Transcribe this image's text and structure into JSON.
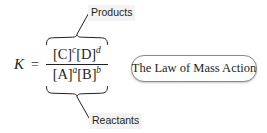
{
  "figure": {
    "background_color": "#ffffff",
    "ink_color": "#231f20",
    "label_background_color": "#f3f3f1",
    "box_border_color": "#8b8b8b"
  },
  "equation": {
    "constant_symbol": "K",
    "relation": "=",
    "numerator": {
      "terms": [
        {
          "species": "[C]",
          "exponent": "c"
        },
        {
          "species": "[D]",
          "exponent": "d"
        }
      ]
    },
    "denominator": {
      "terms": [
        {
          "species": "[A]",
          "exponent": "a"
        },
        {
          "species": "[B]",
          "exponent": "b"
        }
      ]
    }
  },
  "annotations": {
    "products_label": "Products",
    "reactants_label": "Reactants",
    "products_brace": "overbrace-icon",
    "reactants_brace": "underbrace-icon",
    "products_leader": "leader-line-icon",
    "reactants_leader": "leader-line-icon"
  },
  "statement": {
    "text": "The Law of Mass Action"
  }
}
